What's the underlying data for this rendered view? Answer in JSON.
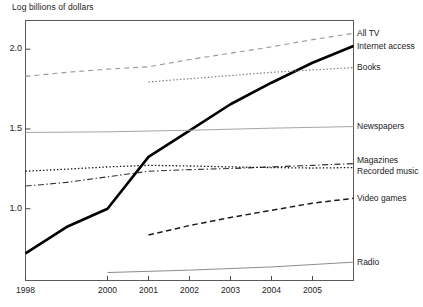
{
  "chart_data": {
    "type": "line",
    "title": "",
    "ylabel": "Log billions of dollars",
    "xlabel": "",
    "xlim": [
      1998,
      2006
    ],
    "ylim": [
      0.55,
      2.18
    ],
    "grid": false,
    "legend_position": "right-of-axes",
    "yticks": [
      "1.0",
      "1.5",
      "2.0"
    ],
    "ytick_values": [
      1.0,
      1.5,
      2.0
    ],
    "xticks": [
      "1998",
      "2000",
      "2001",
      "2002",
      "2003",
      "2004",
      "2005"
    ],
    "xtick_values": [
      1998,
      2000,
      2001,
      2002,
      2003,
      2004,
      2005
    ],
    "x": [
      1998,
      1999,
      2000,
      2001,
      2002,
      2003,
      2004,
      2005,
      2006
    ],
    "series": [
      {
        "name": "All TV",
        "style": "dashed",
        "color": "#9a9a9a",
        "width": 1.1,
        "x": [
          1998,
          1999,
          2000,
          2001,
          2002,
          2003,
          2004,
          2005,
          2006
        ],
        "values": [
          1.83,
          1.855,
          1.875,
          1.89,
          1.935,
          1.975,
          2.015,
          2.06,
          2.1
        ]
      },
      {
        "name": "Internet access",
        "style": "solid",
        "color": "#000000",
        "width": 2.6,
        "x": [
          1998,
          1999,
          2000,
          2001,
          2002,
          2003,
          2004,
          2005,
          2006
        ],
        "values": [
          0.72,
          0.885,
          1.0,
          1.325,
          1.49,
          1.655,
          1.79,
          1.915,
          2.02
        ]
      },
      {
        "name": "Books",
        "style": "dotted",
        "color": "#7a7a7a",
        "width": 1.2,
        "x": [
          2001,
          2002,
          2003,
          2004,
          2005,
          2006
        ],
        "values": [
          1.795,
          1.815,
          1.835,
          1.855,
          1.87,
          1.885
        ]
      },
      {
        "name": "Newspapers",
        "style": "solid",
        "color": "#a6a6a6",
        "width": 1.0,
        "x": [
          1998,
          2000,
          2002,
          2004,
          2006
        ],
        "values": [
          1.478,
          1.482,
          1.492,
          1.505,
          1.515
        ]
      },
      {
        "name": "Magazines",
        "style": "dashdot",
        "color": "#333333",
        "width": 1.1,
        "x": [
          1998,
          1999,
          2000,
          2001,
          2002,
          2003,
          2004,
          2005,
          2006
        ],
        "values": [
          1.142,
          1.165,
          1.2,
          1.235,
          1.245,
          1.252,
          1.262,
          1.272,
          1.283
        ]
      },
      {
        "name": "Recorded music",
        "style": "dotted",
        "color": "#111111",
        "width": 1.3,
        "x": [
          1998,
          1999,
          2000,
          2001,
          2002,
          2003,
          2004,
          2005,
          2006
        ],
        "values": [
          1.235,
          1.248,
          1.262,
          1.272,
          1.268,
          1.262,
          1.258,
          1.255,
          1.258
        ]
      },
      {
        "name": "Video games",
        "style": "dashed",
        "color": "#1a1a1a",
        "width": 1.5,
        "x": [
          2001,
          2002,
          2003,
          2004,
          2005,
          2006
        ],
        "values": [
          0.835,
          0.895,
          0.945,
          0.99,
          1.035,
          1.065
        ]
      },
      {
        "name": "Radio",
        "style": "solid",
        "color": "#8c8c8c",
        "width": 1.0,
        "x": [
          2000,
          2002,
          2004,
          2006
        ],
        "values": [
          0.6,
          0.615,
          0.635,
          0.665
        ]
      }
    ],
    "legend_entries": [
      {
        "label": "All TV",
        "y_value": 2.1
      },
      {
        "label": "Internet access",
        "y_value": 2.02
      },
      {
        "label": "Books",
        "y_value": 1.885
      },
      {
        "label": "Newspapers",
        "y_value": 1.515
      },
      {
        "label": "Magazines",
        "y_value": 1.3
      },
      {
        "label": "Recorded music",
        "y_value": 1.235
      },
      {
        "label": "Video games",
        "y_value": 1.065
      },
      {
        "label": "Radio",
        "y_value": 0.665
      }
    ]
  }
}
